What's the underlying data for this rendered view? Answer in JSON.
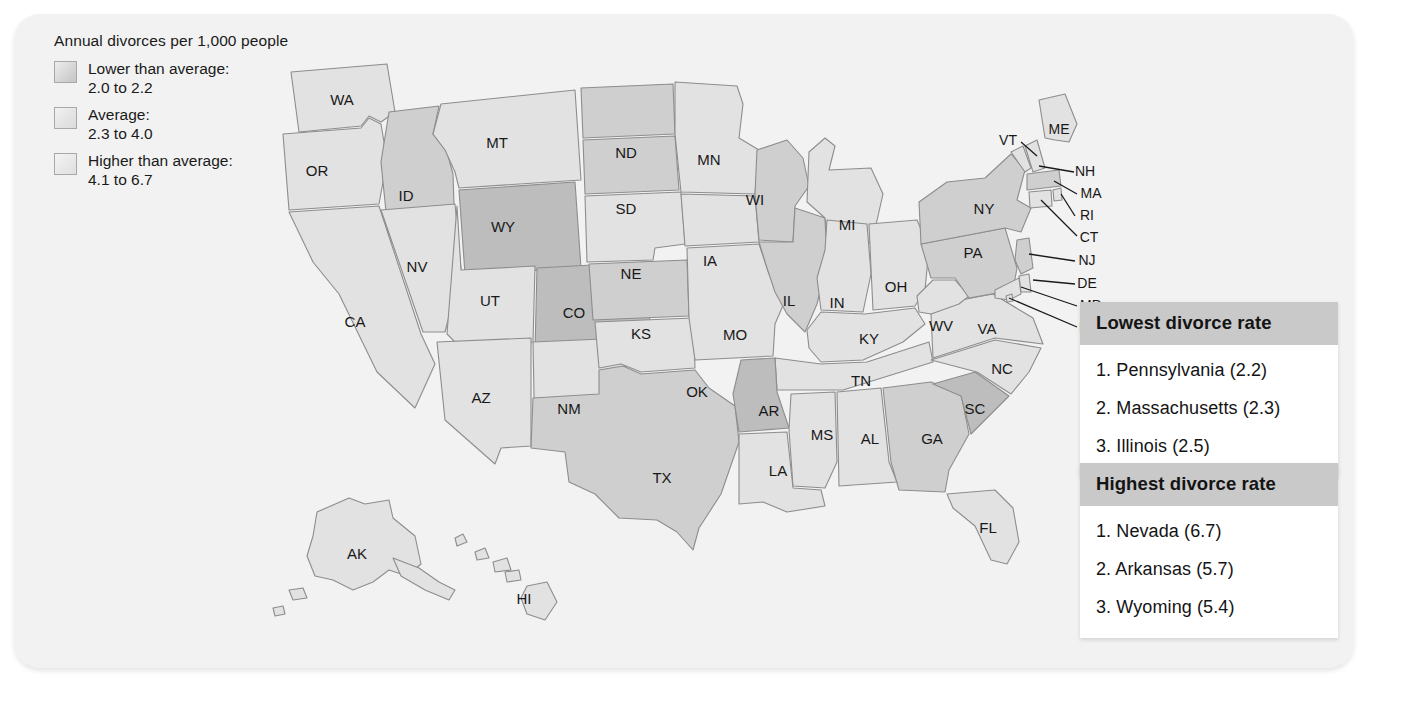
{
  "legend": {
    "title": "Annual divorces per 1,000 people",
    "items": [
      {
        "swatch": "low",
        "line1": "Lower than average:",
        "line2": "2.0 to 2.2"
      },
      {
        "swatch": "avg",
        "line1": "Average:",
        "line2": "2.3  to 4.0"
      },
      {
        "swatch": "high",
        "line1": "Higher than average:",
        "line2": "4.1 to 6.7"
      }
    ]
  },
  "tables": [
    {
      "id": "lowest",
      "header": "Lowest divorce rate",
      "rows": [
        "1. Pennsylvania (2.2)",
        "2. Massachusetts (2.3)",
        "3. Illinois (2.5)"
      ]
    },
    {
      "id": "highest",
      "header": "Highest divorce rate",
      "rows": [
        "1. Nevada (6.7)",
        "2. Arkansas (5.7)",
        "3. Wyoming (5.4)"
      ]
    }
  ],
  "map": {
    "labels": [
      {
        "abbr": "WA",
        "x": 73,
        "y": 59
      },
      {
        "abbr": "OR",
        "x": 48,
        "y": 130
      },
      {
        "abbr": "ID",
        "x": 137,
        "y": 155
      },
      {
        "abbr": "MT",
        "x": 228,
        "y": 102
      },
      {
        "abbr": "ND",
        "x": 357,
        "y": 112
      },
      {
        "abbr": "SD",
        "x": 357,
        "y": 168
      },
      {
        "abbr": "NE",
        "x": 362,
        "y": 233
      },
      {
        "abbr": "KS",
        "x": 372,
        "y": 293
      },
      {
        "abbr": "MN",
        "x": 440,
        "y": 119
      },
      {
        "abbr": "IA",
        "x": 441,
        "y": 220
      },
      {
        "abbr": "MO",
        "x": 466,
        "y": 294
      },
      {
        "abbr": "WI",
        "x": 486,
        "y": 159
      },
      {
        "abbr": "IL",
        "x": 520,
        "y": 260
      },
      {
        "abbr": "MI",
        "x": 578,
        "y": 184
      },
      {
        "abbr": "IN",
        "x": 568,
        "y": 262
      },
      {
        "abbr": "OH",
        "x": 627,
        "y": 246
      },
      {
        "abbr": "KY",
        "x": 600,
        "y": 298
      },
      {
        "abbr": "TN",
        "x": 592,
        "y": 340
      },
      {
        "abbr": "WV",
        "x": 672,
        "y": 285
      },
      {
        "abbr": "VA",
        "x": 718,
        "y": 288
      },
      {
        "abbr": "NC",
        "x": 733,
        "y": 328
      },
      {
        "abbr": "SC",
        "x": 706,
        "y": 368
      },
      {
        "abbr": "GA",
        "x": 663,
        "y": 398
      },
      {
        "abbr": "AL",
        "x": 601,
        "y": 398
      },
      {
        "abbr": "MS",
        "x": 553,
        "y": 394
      },
      {
        "abbr": "LA",
        "x": 509,
        "y": 430
      },
      {
        "abbr": "AR",
        "x": 500,
        "y": 370
      },
      {
        "abbr": "OK",
        "x": 428,
        "y": 351
      },
      {
        "abbr": "TX",
        "x": 393,
        "y": 437
      },
      {
        "abbr": "NM",
        "x": 300,
        "y": 368
      },
      {
        "abbr": "AZ",
        "x": 212,
        "y": 357
      },
      {
        "abbr": "UT",
        "x": 221,
        "y": 260
      },
      {
        "abbr": "CO",
        "x": 305,
        "y": 272
      },
      {
        "abbr": "WY",
        "x": 234,
        "y": 186
      },
      {
        "abbr": "NV",
        "x": 148,
        "y": 226
      },
      {
        "abbr": "CA",
        "x": 86,
        "y": 281
      },
      {
        "abbr": "FL",
        "x": 719,
        "y": 487
      },
      {
        "abbr": "PA",
        "x": 704,
        "y": 212
      },
      {
        "abbr": "NY",
        "x": 715,
        "y": 168
      },
      {
        "abbr": "AK",
        "x": 88,
        "y": 513
      },
      {
        "abbr": "HI",
        "x": 255,
        "y": 558
      }
    ],
    "callouts": [
      {
        "abbr": "VT",
        "x": 739,
        "y": 99
      },
      {
        "abbr": "ME",
        "x": 790,
        "y": 88
      },
      {
        "abbr": "NH",
        "x": 816,
        "y": 130
      },
      {
        "abbr": "MA",
        "x": 822,
        "y": 152
      },
      {
        "abbr": "RI",
        "x": 818,
        "y": 174
      },
      {
        "abbr": "CT",
        "x": 820,
        "y": 196
      },
      {
        "abbr": "NJ",
        "x": 818,
        "y": 219
      },
      {
        "abbr": "DE",
        "x": 818,
        "y": 242
      },
      {
        "abbr": "MD",
        "x": 822,
        "y": 264
      },
      {
        "abbr": "DC",
        "x": 820,
        "y": 286
      }
    ]
  }
}
